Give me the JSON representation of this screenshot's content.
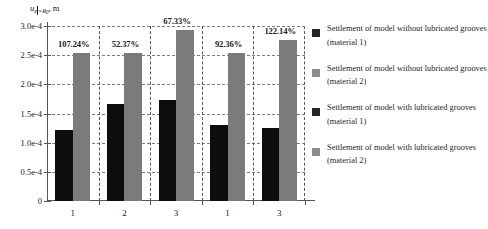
{
  "chart_data": {
    "type": "bar",
    "title": "",
    "ylabel": "u_z|_{r=R_0}, m",
    "ylabel_parts": {
      "variable": "u",
      "variable_sub": "z",
      "condition": "r=R",
      "condition_sub": "0",
      "unit": "m"
    },
    "xlabel": "",
    "categories": [
      "1",
      "2",
      "3",
      "1",
      "3"
    ],
    "ylim": [
      0,
      0.0003
    ],
    "ytick_labels": [
      "0",
      "0.5e-4",
      "1.0e-4",
      "1.5e-4",
      "2.0e-4",
      "2.5e-4",
      "3.0e-4"
    ],
    "ytick_values": [
      0,
      5e-05,
      0.0001,
      0.00015,
      0.0002,
      0.00025,
      0.0003
    ],
    "grid": true,
    "legend_position": "right",
    "series": [
      {
        "name": "dark",
        "color": "#0d0d0d",
        "values": [
          0.000122,
          0.000166,
          0.000173,
          0.000131,
          0.000125
        ]
      },
      {
        "name": "gray",
        "color": "#7b7b7b",
        "values": [
          0.000253,
          0.000254,
          0.000293,
          0.000253,
          0.000276
        ]
      }
    ],
    "annotations": [
      "107.24%",
      "52.37%",
      "67.33%",
      "92.36%",
      "122.14%"
    ]
  },
  "legend": {
    "items": [
      {
        "swatch": "dark",
        "label": "Settlement of model without lubricated grooves (material 1)"
      },
      {
        "swatch": "gray",
        "label": "Settlement of model without lubricated grooves (material 2)"
      },
      {
        "swatch": "dark",
        "label": "Settlement of model with lubricated grooves (material 1)"
      },
      {
        "swatch": "gray",
        "label": "Settlement of model with lubricated grooves (material 2)"
      }
    ]
  }
}
